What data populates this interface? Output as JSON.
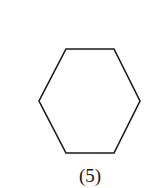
{
  "figure": {
    "shape": "hexagon",
    "stroke_color": "#1a1a1a",
    "fill_color": "#ffffff",
    "stroke_width": 1.6,
    "vertices": [
      [
        66,
        49
      ],
      [
        114,
        49
      ],
      [
        140,
        101
      ],
      [
        114,
        153
      ],
      [
        66,
        153
      ],
      [
        39,
        101
      ]
    ],
    "label": "(5)"
  }
}
